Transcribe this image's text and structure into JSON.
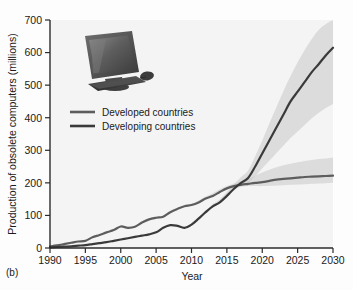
{
  "panel": {
    "label": "(b)"
  },
  "chart_data": {
    "type": "line",
    "title": "",
    "xlabel": "Year",
    "ylabel": "Production of obsolete computers (millions)",
    "xlim": [
      1990,
      2030
    ],
    "ylim": [
      0,
      700
    ],
    "xticks": [
      1990,
      1995,
      2000,
      2005,
      2010,
      2015,
      2020,
      2025,
      2030
    ],
    "yticks": [
      0,
      100,
      200,
      300,
      400,
      500,
      600,
      700
    ],
    "grid": false,
    "legend_position": "upper-left",
    "x": [
      1990,
      1991,
      1992,
      1993,
      1994,
      1995,
      1996,
      1997,
      1998,
      1999,
      2000,
      2001,
      2002,
      2003,
      2004,
      2005,
      2006,
      2007,
      2008,
      2009,
      2010,
      2011,
      2012,
      2013,
      2014,
      2015,
      2016,
      2017,
      2018,
      2019,
      2020,
      2021,
      2022,
      2023,
      2024,
      2025,
      2026,
      2027,
      2028,
      2029,
      2030
    ],
    "series": [
      {
        "name": "Developed countries",
        "color": "#5d5d5d",
        "values": [
          5,
          8,
          12,
          16,
          20,
          22,
          33,
          40,
          48,
          55,
          66,
          62,
          65,
          78,
          88,
          93,
          96,
          110,
          120,
          128,
          132,
          140,
          152,
          160,
          172,
          183,
          190,
          194,
          197,
          200,
          202,
          206,
          210,
          212,
          214,
          216,
          218,
          219,
          220,
          221,
          222
        ],
        "band_low": [
          5,
          8,
          12,
          16,
          20,
          22,
          33,
          40,
          48,
          55,
          66,
          62,
          65,
          78,
          88,
          93,
          96,
          110,
          120,
          128,
          132,
          140,
          152,
          160,
          172,
          180,
          185,
          188,
          190,
          190,
          190,
          191,
          192,
          193,
          194,
          195,
          196,
          197,
          198,
          199,
          200
        ],
        "band_high": [
          5,
          8,
          12,
          16,
          20,
          22,
          33,
          40,
          48,
          55,
          66,
          62,
          65,
          78,
          88,
          93,
          96,
          110,
          122,
          130,
          136,
          146,
          158,
          168,
          180,
          190,
          198,
          205,
          212,
          222,
          232,
          240,
          248,
          254,
          259,
          263,
          267,
          270,
          273,
          275,
          278
        ]
      },
      {
        "name": "Developing countries",
        "color": "#3a3a3a",
        "values": [
          2,
          3,
          4,
          5,
          7,
          9,
          12,
          15,
          18,
          22,
          26,
          30,
          34,
          38,
          42,
          48,
          62,
          70,
          68,
          62,
          72,
          90,
          110,
          128,
          140,
          160,
          182,
          200,
          215,
          250,
          290,
          330,
          370,
          410,
          450,
          480,
          510,
          540,
          565,
          592,
          615
        ],
        "band_low": [
          2,
          3,
          4,
          5,
          7,
          9,
          12,
          15,
          18,
          22,
          26,
          30,
          34,
          38,
          42,
          48,
          62,
          70,
          68,
          62,
          72,
          90,
          110,
          128,
          140,
          158,
          176,
          190,
          200,
          220,
          245,
          268,
          292,
          315,
          338,
          358,
          378,
          398,
          415,
          430,
          442
        ],
        "band_high": [
          2,
          3,
          4,
          5,
          7,
          9,
          12,
          15,
          18,
          22,
          26,
          30,
          34,
          38,
          42,
          48,
          62,
          70,
          68,
          62,
          72,
          92,
          114,
          134,
          150,
          172,
          196,
          218,
          238,
          282,
          330,
          382,
          432,
          482,
          528,
          570,
          608,
          642,
          670,
          688,
          700
        ]
      }
    ],
    "band_color": "#c9c9c9",
    "annotations": [
      {
        "name": "computer-photo",
        "description": "photo of CRT monitor, keyboard and mouse"
      }
    ]
  }
}
